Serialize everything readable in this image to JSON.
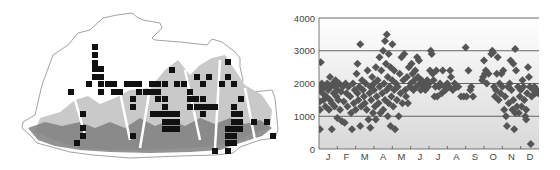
{
  "figure": {
    "left_panel": {
      "type": "distribution-map",
      "region": "Bhutan",
      "colors": {
        "outline": "#8a8a8a",
        "lowland_relief": "#7f7f7f",
        "midland_relief": "#c9c9c9",
        "highland": "#ffffff",
        "record_square": "#111111"
      },
      "record_squares": [
        [
          95,
          47
        ],
        [
          95,
          55
        ],
        [
          95,
          63
        ],
        [
          95,
          69
        ],
        [
          101,
          69
        ],
        [
          95,
          77
        ],
        [
          101,
          77
        ],
        [
          89,
          84
        ],
        [
          101,
          84
        ],
        [
          108,
          84
        ],
        [
          114,
          84
        ],
        [
          127,
          84
        ],
        [
          133,
          84
        ],
        [
          139,
          84
        ],
        [
          152,
          84
        ],
        [
          158,
          84
        ],
        [
          165,
          84
        ],
        [
          177,
          84
        ],
        [
          184,
          84
        ],
        [
          203,
          84
        ],
        [
          222,
          84
        ],
        [
          234,
          84
        ],
        [
          71,
          92
        ],
        [
          101,
          92
        ],
        [
          114,
          92
        ],
        [
          120,
          92
        ],
        [
          139,
          92
        ],
        [
          146,
          92
        ],
        [
          152,
          92
        ],
        [
          158,
          92
        ],
        [
          190,
          92
        ],
        [
          133,
          99
        ],
        [
          158,
          99
        ],
        [
          165,
          99
        ],
        [
          190,
          99
        ],
        [
          196,
          99
        ],
        [
          203,
          99
        ],
        [
          241,
          99
        ],
        [
          133,
          107
        ],
        [
          165,
          107
        ],
        [
          190,
          107
        ],
        [
          197,
          107
        ],
        [
          203,
          107
        ],
        [
          209,
          107
        ],
        [
          215,
          107
        ],
        [
          234,
          107
        ],
        [
          83,
          114
        ],
        [
          153,
          114
        ],
        [
          159,
          114
        ],
        [
          165,
          114
        ],
        [
          171,
          114
        ],
        [
          177,
          114
        ],
        [
          203,
          114
        ],
        [
          234,
          114
        ],
        [
          240,
          114
        ],
        [
          165,
          122
        ],
        [
          171,
          122
        ],
        [
          177,
          122
        ],
        [
          234,
          122
        ],
        [
          240,
          122
        ],
        [
          254,
          122
        ],
        [
          267,
          122
        ],
        [
          83,
          128
        ],
        [
          165,
          129
        ],
        [
          171,
          129
        ],
        [
          177,
          129
        ],
        [
          228,
          129
        ],
        [
          234,
          129
        ],
        [
          240,
          129
        ],
        [
          83,
          136
        ],
        [
          133,
          136
        ],
        [
          228,
          136
        ],
        [
          234,
          136
        ],
        [
          273,
          136
        ],
        [
          77,
          143
        ],
        [
          228,
          143
        ],
        [
          234,
          143
        ],
        [
          215,
          151
        ],
        [
          228,
          151
        ],
        [
          172,
          70
        ],
        [
          197,
          77
        ],
        [
          209,
          77
        ],
        [
          228,
          77
        ],
        [
          228,
          62
        ]
      ]
    },
    "right_panel": {
      "type": "scatter"
    }
  },
  "chart_data": {
    "type": "scatter",
    "title": "",
    "xlabel": "",
    "ylabel": "",
    "categories": [
      "J",
      "F",
      "M",
      "A",
      "M",
      "J",
      "J",
      "A",
      "S",
      "O",
      "N",
      "D"
    ],
    "yticks": [
      "0",
      "1000",
      "2000",
      "3000",
      "4000"
    ],
    "ylim": [
      0,
      4000
    ],
    "xlim": [
      0,
      12
    ],
    "grid": {
      "horizontal": [
        1000,
        2000,
        3000,
        4000
      ],
      "vertical": false
    },
    "legend": null,
    "background": {
      "gradient_top": "#ffffff",
      "gradient_bottom": "#d8d8d8"
    },
    "marker": {
      "shape": "diamond",
      "color": "#555555",
      "size": 8
    },
    "points": [
      [
        0.05,
        600
      ],
      [
        0.05,
        1200
      ],
      [
        0.05,
        1450
      ],
      [
        0.05,
        1900
      ],
      [
        0.1,
        2650
      ],
      [
        0.1,
        1800
      ],
      [
        0.15,
        2000
      ],
      [
        0.2,
        1700
      ],
      [
        0.25,
        1500
      ],
      [
        0.3,
        1900
      ],
      [
        0.35,
        1300
      ],
      [
        0.4,
        1600
      ],
      [
        0.45,
        2000
      ],
      [
        0.5,
        1800
      ],
      [
        0.55,
        1200
      ],
      [
        0.6,
        1500
      ],
      [
        0.6,
        2200
      ],
      [
        0.65,
        1900
      ],
      [
        0.7,
        600
      ],
      [
        0.7,
        1400
      ],
      [
        0.75,
        2000
      ],
      [
        0.8,
        1700
      ],
      [
        0.85,
        1300
      ],
      [
        0.9,
        2100
      ],
      [
        0.9,
        1900
      ],
      [
        0.95,
        1600
      ],
      [
        1.0,
        950
      ],
      [
        1.0,
        1800
      ],
      [
        1.05,
        1500
      ],
      [
        1.1,
        2000
      ],
      [
        1.15,
        1200
      ],
      [
        1.2,
        1750
      ],
      [
        1.25,
        850
      ],
      [
        1.3,
        1900
      ],
      [
        1.35,
        1450
      ],
      [
        1.4,
        800
      ],
      [
        1.45,
        2000
      ],
      [
        1.5,
        1700
      ],
      [
        1.55,
        1300
      ],
      [
        1.6,
        1900
      ],
      [
        1.7,
        1600
      ],
      [
        1.75,
        1100
      ],
      [
        1.8,
        600
      ],
      [
        1.85,
        2000
      ],
      [
        1.9,
        1400
      ],
      [
        1.95,
        1800
      ],
      [
        2.0,
        1200
      ],
      [
        2.05,
        2300
      ],
      [
        2.1,
        1700
      ],
      [
        2.1,
        2600
      ],
      [
        2.15,
        1500
      ],
      [
        2.2,
        1900
      ],
      [
        2.25,
        3200
      ],
      [
        2.25,
        700
      ],
      [
        2.3,
        1300
      ],
      [
        2.35,
        2100
      ],
      [
        2.4,
        1800
      ],
      [
        2.45,
        1600
      ],
      [
        2.5,
        1400
      ],
      [
        2.55,
        2000
      ],
      [
        2.6,
        1200
      ],
      [
        2.65,
        2400
      ],
      [
        2.7,
        900
      ],
      [
        2.75,
        1700
      ],
      [
        2.8,
        1900
      ],
      [
        2.8,
        650
      ],
      [
        2.85,
        1500
      ],
      [
        2.9,
        2200
      ],
      [
        2.95,
        1100
      ],
      [
        3.0,
        2000
      ],
      [
        3.0,
        1800
      ],
      [
        3.05,
        1300
      ],
      [
        3.1,
        2500
      ],
      [
        3.1,
        900
      ],
      [
        3.15,
        1600
      ],
      [
        3.2,
        2100
      ],
      [
        3.25,
        1400
      ],
      [
        3.3,
        2800
      ],
      [
        3.3,
        1900
      ],
      [
        3.35,
        1100
      ],
      [
        3.4,
        2400
      ],
      [
        3.45,
        1700
      ],
      [
        3.5,
        3000
      ],
      [
        3.5,
        1200
      ],
      [
        3.55,
        2000
      ],
      [
        3.6,
        1500
      ],
      [
        3.6,
        3300
      ],
      [
        3.65,
        2600
      ],
      [
        3.7,
        1800
      ],
      [
        3.7,
        3500
      ],
      [
        3.75,
        2200
      ],
      [
        3.75,
        1000
      ],
      [
        3.8,
        2900
      ],
      [
        3.8,
        1400
      ],
      [
        3.85,
        1900
      ],
      [
        3.9,
        2500
      ],
      [
        3.9,
        700
      ],
      [
        3.95,
        1600
      ],
      [
        4.0,
        2100
      ],
      [
        4.0,
        3200
      ],
      [
        4.05,
        1300
      ],
      [
        4.1,
        2400
      ],
      [
        4.1,
        1800
      ],
      [
        4.15,
        600
      ],
      [
        4.2,
        2000
      ],
      [
        4.25,
        1500
      ],
      [
        4.3,
        1900
      ],
      [
        4.35,
        1000
      ],
      [
        4.4,
        2300
      ],
      [
        4.45,
        1700
      ],
      [
        4.5,
        2800
      ],
      [
        4.55,
        1400
      ],
      [
        4.6,
        2100
      ],
      [
        4.65,
        2900
      ],
      [
        4.7,
        1800
      ],
      [
        4.75,
        1600
      ],
      [
        4.8,
        2200
      ],
      [
        4.85,
        1400
      ],
      [
        4.9,
        2500
      ],
      [
        4.95,
        1900
      ],
      [
        5.0,
        2000
      ],
      [
        5.05,
        2600
      ],
      [
        5.1,
        2300
      ],
      [
        5.15,
        1800
      ],
      [
        5.2,
        2100
      ],
      [
        5.25,
        2400
      ],
      [
        5.3,
        1900
      ],
      [
        5.35,
        2800
      ],
      [
        5.4,
        2200
      ],
      [
        5.45,
        2700
      ],
      [
        5.5,
        2000
      ],
      [
        5.55,
        1800
      ],
      [
        5.6,
        2100
      ],
      [
        5.7,
        1900
      ],
      [
        5.75,
        2000
      ],
      [
        5.8,
        1800
      ],
      [
        5.9,
        2100
      ],
      [
        5.95,
        1900
      ],
      [
        6.0,
        2000
      ],
      [
        6.05,
        2400
      ],
      [
        6.1,
        3000
      ],
      [
        6.15,
        2900
      ],
      [
        6.2,
        2300
      ],
      [
        6.25,
        2100
      ],
      [
        6.3,
        1600
      ],
      [
        6.35,
        1900
      ],
      [
        6.4,
        2400
      ],
      [
        6.45,
        1600
      ],
      [
        6.55,
        1900
      ],
      [
        6.6,
        2000
      ],
      [
        6.7,
        1700
      ],
      [
        6.75,
        2400
      ],
      [
        6.85,
        1900
      ],
      [
        6.9,
        1800
      ],
      [
        7.0,
        2000
      ],
      [
        7.1,
        1900
      ],
      [
        7.15,
        2400
      ],
      [
        7.2,
        2200
      ],
      [
        7.3,
        1800
      ],
      [
        7.4,
        2000
      ],
      [
        7.5,
        1900
      ],
      [
        7.6,
        1900
      ],
      [
        7.75,
        1600
      ],
      [
        7.9,
        1600
      ],
      [
        8.0,
        3100
      ],
      [
        8.05,
        1600
      ],
      [
        8.15,
        2400
      ],
      [
        8.25,
        1800
      ],
      [
        8.3,
        1900
      ],
      [
        8.4,
        1600
      ],
      [
        8.9,
        2100
      ],
      [
        8.95,
        2200
      ],
      [
        9.0,
        2700
      ],
      [
        9.05,
        2300
      ],
      [
        9.1,
        2400
      ],
      [
        9.15,
        2000
      ],
      [
        9.25,
        2300
      ],
      [
        9.4,
        2900
      ],
      [
        9.45,
        3000
      ],
      [
        9.5,
        2950
      ],
      [
        9.55,
        1900
      ],
      [
        9.6,
        1600
      ],
      [
        9.65,
        1800
      ],
      [
        9.7,
        2300
      ],
      [
        9.75,
        2800
      ],
      [
        9.8,
        1500
      ],
      [
        9.85,
        2000
      ],
      [
        9.9,
        1700
      ],
      [
        9.95,
        2300
      ],
      [
        10.0,
        1900
      ],
      [
        10.05,
        2400
      ],
      [
        10.1,
        1200
      ],
      [
        10.15,
        1600
      ],
      [
        10.2,
        1000
      ],
      [
        10.25,
        700
      ],
      [
        10.3,
        1900
      ],
      [
        10.35,
        1400
      ],
      [
        10.4,
        2000
      ],
      [
        10.45,
        2700
      ],
      [
        10.5,
        1800
      ],
      [
        10.55,
        1200
      ],
      [
        10.6,
        2600
      ],
      [
        10.6,
        1500
      ],
      [
        10.65,
        600
      ],
      [
        10.7,
        3050
      ],
      [
        10.7,
        1100
      ],
      [
        10.75,
        2400
      ],
      [
        10.8,
        1300
      ],
      [
        10.85,
        1900
      ],
      [
        10.9,
        1100
      ],
      [
        10.95,
        1600
      ],
      [
        11.0,
        1800
      ],
      [
        11.05,
        1300
      ],
      [
        11.1,
        2100
      ],
      [
        11.15,
        1900
      ],
      [
        11.2,
        1500
      ],
      [
        11.25,
        1000
      ],
      [
        11.3,
        1200
      ],
      [
        11.3,
        900
      ],
      [
        11.35,
        1700
      ],
      [
        11.4,
        2500
      ],
      [
        11.45,
        2200
      ],
      [
        11.5,
        1900
      ],
      [
        11.55,
        150
      ],
      [
        11.6,
        1600
      ],
      [
        11.7,
        1800
      ],
      [
        11.75,
        1900
      ],
      [
        11.8,
        1700
      ],
      [
        11.9,
        1800
      ],
      [
        11.95,
        1700
      ]
    ]
  }
}
